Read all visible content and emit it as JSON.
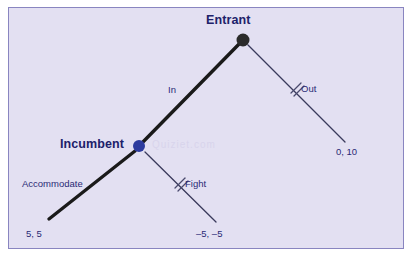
{
  "diagram": {
    "type": "extensive-form-game-tree",
    "title_watermark": "Quiziet.com",
    "colors": {
      "background": "#e3e0f2",
      "border": "#8985c0",
      "page": "#ffffff",
      "entrant_node": "#2b2b2b",
      "incumbent_node": "#2d3b9e",
      "equilibrium_path_line": "#1a1a1a",
      "off_path_line": "#3a3a5c",
      "label_text": "#20216a",
      "branch_text": "#2a2a75",
      "strike_mark": "#4a4a6e"
    },
    "nodes": [
      {
        "id": "entrant",
        "label": "Entrant",
        "player": "Entrant",
        "x": 243,
        "y": 40,
        "radius": 6.5,
        "color": "#2b2b2b",
        "label_position": "above"
      },
      {
        "id": "incumbent",
        "label": "Incumbent",
        "player": "Incumbent",
        "x": 139,
        "y": 146,
        "radius": 6,
        "color": "#2d3b9e",
        "label_position": "left"
      }
    ],
    "branches": [
      {
        "id": "in",
        "label": "In",
        "from": "entrant",
        "to": "incumbent",
        "x1": 243,
        "y1": 40,
        "x2": 139,
        "y2": 146,
        "thick": true,
        "on_equilibrium_path": true,
        "struck_out": false
      },
      {
        "id": "out",
        "label": "Out",
        "from": "entrant",
        "to": "payoff-right",
        "x1": 248,
        "y1": 45,
        "x2": 345,
        "y2": 142,
        "thick": false,
        "on_equilibrium_path": false,
        "struck_out": true
      },
      {
        "id": "accommodate",
        "label": "Accommodate",
        "from": "incumbent",
        "to": "payoff-left",
        "x1": 135,
        "y1": 151,
        "x2": 49,
        "y2": 219,
        "thick": true,
        "on_equilibrium_path": true,
        "struck_out": false
      },
      {
        "id": "fight",
        "label": "Fight",
        "from": "incumbent",
        "to": "payoff-mid",
        "x1": 145,
        "y1": 152,
        "x2": 216,
        "y2": 222,
        "thick": false,
        "on_equilibrium_path": false,
        "struck_out": true
      }
    ],
    "payoffs": [
      {
        "id": "payoff-left",
        "text": "5, 5",
        "entrant": 5,
        "incumbent": 5,
        "x": 26,
        "y": 228,
        "outcome": "In then Accommodate"
      },
      {
        "id": "payoff-mid",
        "text": "–5, –5",
        "entrant": -5,
        "incumbent": -5,
        "x": 196,
        "y": 228,
        "outcome": "In then Fight"
      },
      {
        "id": "payoff-right",
        "text": "0, 10",
        "entrant": 0,
        "incumbent": 10,
        "x": 336,
        "y": 146,
        "outcome": "Out"
      }
    ],
    "strike_marks": [
      {
        "branch": "out",
        "x": 296,
        "y": 92,
        "angle": 45
      },
      {
        "branch": "fight",
        "x": 180,
        "y": 187,
        "angle": 45
      }
    ]
  }
}
